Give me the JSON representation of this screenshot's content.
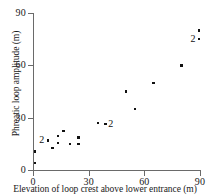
{
  "chart_data": {
    "type": "scatter",
    "title": "",
    "xlabel": "Elevation of loop crest above lower entrance (m)",
    "ylabel": "Phreatic loop amplitude (m)",
    "xlim": [
      0,
      90
    ],
    "ylim": [
      0,
      90
    ],
    "xticks": [
      0,
      30,
      60,
      90
    ],
    "yticks": [
      0,
      30,
      60,
      90
    ],
    "xticklabels": [
      "0",
      "30",
      "60",
      "90"
    ],
    "yticklabels": [
      "0",
      "30",
      "60",
      "90"
    ],
    "grid": false,
    "legend": false,
    "overlap_marker_label": "2",
    "overlap_note": "A '2' beside a marker indicates two coincident data points",
    "points": [
      {
        "x": 1.0,
        "y": 10.5,
        "count": 1
      },
      {
        "x": 1.0,
        "y": 4.0,
        "count": 1
      },
      {
        "x": 8.0,
        "y": 17.0,
        "count": 2,
        "label": "2",
        "label_side": "left"
      },
      {
        "x": 10.5,
        "y": 12.5,
        "count": 1
      },
      {
        "x": 13.5,
        "y": 19.5,
        "count": 1
      },
      {
        "x": 13.5,
        "y": 15.5,
        "count": 1
      },
      {
        "x": 16.5,
        "y": 22.5,
        "count": 1
      },
      {
        "x": 20.0,
        "y": 15.0,
        "count": 1
      },
      {
        "x": 24.5,
        "y": 18.5,
        "count": 1
      },
      {
        "x": 24.5,
        "y": 15.0,
        "count": 1
      },
      {
        "x": 35.0,
        "y": 27.0,
        "count": 1
      },
      {
        "x": 39.0,
        "y": 26.5,
        "count": 2,
        "label": "2",
        "label_side": "right"
      },
      {
        "x": 50.0,
        "y": 45.0,
        "count": 1
      },
      {
        "x": 55.0,
        "y": 35.0,
        "count": 1
      },
      {
        "x": 65.0,
        "y": 50.0,
        "count": 1
      },
      {
        "x": 80.0,
        "y": 60.0,
        "count": 1
      },
      {
        "x": 89.5,
        "y": 80.0,
        "count": 1
      },
      {
        "x": 89.5,
        "y": 75.0,
        "count": 2,
        "label": "2",
        "label_side": "left"
      }
    ]
  }
}
